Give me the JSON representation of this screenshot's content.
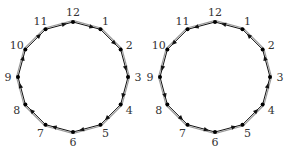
{
  "diagrams": [
    {
      "name": "clockwise-cycle",
      "direction": "clockwise",
      "center": [
        73,
        77
      ],
      "radius": 55,
      "nodes": [
        "12",
        "1",
        "2",
        "3",
        "4",
        "5",
        "6",
        "7",
        "8",
        "9",
        "10",
        "11"
      ]
    },
    {
      "name": "counterclockwise-cycle",
      "direction": "counterclockwise",
      "center": [
        215,
        77
      ],
      "radius": 55,
      "nodes": [
        "12",
        "1",
        "2",
        "3",
        "4",
        "5",
        "6",
        "7",
        "8",
        "9",
        "10",
        "11"
      ]
    }
  ],
  "colors": {
    "edge": "#111111",
    "edge_shadow": "#9a9a9a",
    "node": "#000000",
    "label": "#333333",
    "background": "#ffffff"
  }
}
